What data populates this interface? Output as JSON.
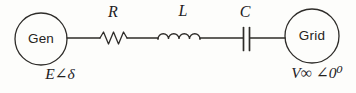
{
  "diagram": {
    "generator": {
      "label": "Gen",
      "voltage_label": "E∠δ"
    },
    "grid": {
      "label": "Grid",
      "voltage_label": "V∞ ∠0⁰"
    },
    "components": {
      "resistor_label": "R",
      "inductor_label": "L",
      "capacitor_label": "C"
    }
  },
  "colors": {
    "stroke": "#2e2c29",
    "text": "#1c1a18",
    "background": "#fdfdfb"
  }
}
